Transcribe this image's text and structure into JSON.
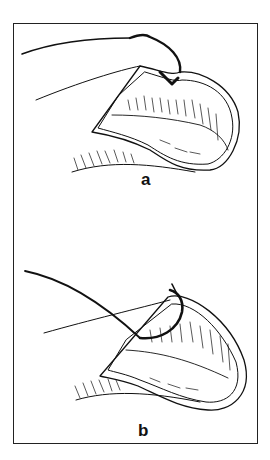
{
  "figure": {
    "panels": [
      {
        "label": "a",
        "description": "Suture needle passing through nail fold with thread"
      },
      {
        "label": "b",
        "description": "Curved needle with suture through nail plate"
      }
    ],
    "colors": {
      "line": "#111111",
      "background": "#ffffff"
    }
  }
}
